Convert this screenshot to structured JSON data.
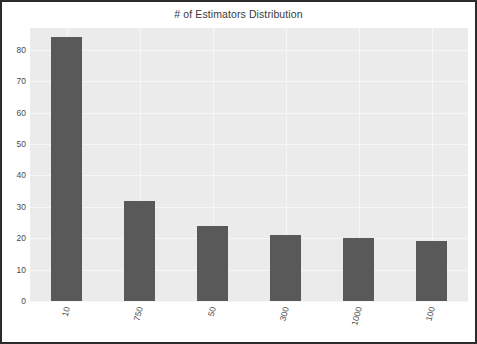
{
  "chart_data": {
    "type": "bar",
    "title": "# of Estimators Distribution",
    "xlabel": "",
    "ylabel": "",
    "categories": [
      "10",
      "750",
      "50",
      "300",
      "1000",
      "100"
    ],
    "values": [
      84,
      32,
      24,
      21,
      20,
      19
    ],
    "ylim": [
      0,
      87
    ],
    "yticks": [
      0,
      10,
      20,
      30,
      40,
      50,
      60,
      70,
      80
    ],
    "ytick_labels": [
      "0",
      "10",
      "20",
      "30",
      "40",
      "50",
      "60",
      "70",
      "80"
    ],
    "grid": true,
    "legend": null,
    "bar_color": "#595959",
    "plot_background": "#ebebeb",
    "figure_background": "#ffffff",
    "grid_color": "#f6f6f6",
    "frame_color": "#2b2b2b",
    "xtick_rotation": -75
  }
}
